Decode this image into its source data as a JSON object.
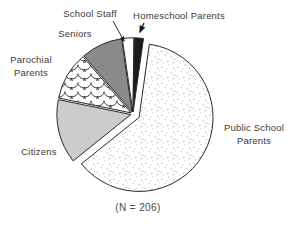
{
  "chart_data": {
    "type": "pie",
    "title": "",
    "caption": "(N = 206)",
    "sample_size_text": "(N = 206)",
    "legend_position": "labels-around-pie",
    "slices": [
      {
        "label": "Public School Parents",
        "percent": 62,
        "fill": "stipple",
        "exploded": true
      },
      {
        "label": "Citizens",
        "percent": 14,
        "fill": "#cccccc",
        "exploded": false
      },
      {
        "label": "Parochial Parents",
        "percent": 10.5,
        "fill": "fish-scale",
        "exploded": false
      },
      {
        "label": "Seniors",
        "percent": 9,
        "fill": "#8a8a8a",
        "exploded": false
      },
      {
        "label": "School Staff",
        "percent": 2.5,
        "fill": "#ffffff",
        "exploded": false
      },
      {
        "label": "Homeschool Parents",
        "percent": 2,
        "fill": "#1c1c1c",
        "exploded": false
      }
    ],
    "outline_color": "#2b2b2b",
    "gap_color": "#ffffff"
  },
  "labels": {
    "school_staff": "School Staff",
    "homeschool_parents": "Homeschool Parents",
    "seniors": "Seniors",
    "parochial_line1": "Parochial",
    "parochial_line2": "Parents",
    "citizens": "Citizens",
    "public_school_line1": "Public School",
    "public_school_line2": "Parents",
    "caption": "(N = 206)"
  }
}
